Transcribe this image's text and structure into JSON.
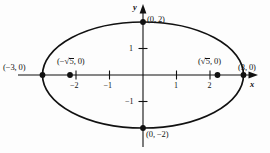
{
  "figure": {
    "kind": "ellipse-graph",
    "equation_implied": "x^2/9 + y^2/4 = 1",
    "background_color": "#fdfdfd",
    "stroke_color": "#111111"
  },
  "axes": {
    "x_axis_label": "x",
    "y_axis_label": "y",
    "origin_px": {
      "x": 143,
      "y": 75
    },
    "unit_px": {
      "x": 33.5,
      "y": 26.5
    },
    "x_ticks": [
      {
        "value": -2,
        "label": "−2",
        "px": 76
      },
      {
        "value": -1,
        "label": "−1",
        "px": 109.5
      },
      {
        "value": 1,
        "label": "1",
        "px": 176.5
      },
      {
        "value": 2,
        "label": "2",
        "px": 210
      }
    ],
    "y_ticks": [
      {
        "value": 1,
        "label": "1",
        "px": 48.5
      },
      {
        "value": -1,
        "label": "−1",
        "px": 101.5
      }
    ]
  },
  "curve": {
    "type": "ellipse",
    "center": [
      0,
      0
    ],
    "semi_major_a": 3,
    "semi_minor_b": 2,
    "orientation": "horizontal",
    "center_px": {
      "x": 143,
      "y": 75
    },
    "rx_px": 100.5,
    "ry_px": 53
  },
  "points": [
    {
      "name": "left-vertex",
      "label": "(−3, 0)",
      "coords": [
        -3,
        0
      ],
      "dot_px": {
        "x": 42.5,
        "y": 75
      },
      "label_px": {
        "x": 3,
        "y": 63
      },
      "dot_visible": true
    },
    {
      "name": "right-vertex",
      "label": "(3, 0)",
      "coords": [
        3,
        0
      ],
      "dot_px": {
        "x": 243.5,
        "y": 75
      },
      "label_px": {
        "x": 238,
        "y": 63
      },
      "dot_visible": true
    },
    {
      "name": "top-covertex",
      "label": "(0, 2)",
      "coords": [
        0,
        2
      ],
      "dot_px": {
        "x": 143,
        "y": 22
      },
      "label_px": {
        "x": 147,
        "y": 15
      },
      "dot_visible": true
    },
    {
      "name": "bottom-covertex",
      "label": "(0, −2)",
      "coords": [
        0,
        -2
      ],
      "dot_px": {
        "x": 143,
        "y": 128
      },
      "label_px": {
        "x": 146,
        "y": 130
      },
      "dot_visible": true
    },
    {
      "name": "left-focus",
      "label_prefix": "(−",
      "label_radical": "5",
      "label_suffix": ", 0)",
      "label_plain": "(−√5, 0)",
      "coords": [
        -2.236,
        0
      ],
      "dot_px": {
        "x": 70,
        "y": 75
      },
      "label_px": {
        "x": 57,
        "y": 57
      },
      "dot_visible": true
    },
    {
      "name": "right-focus",
      "label_prefix": "(",
      "label_radical": "5",
      "label_suffix": ", 0)",
      "label_plain": "(√5, 0)",
      "coords": [
        2.236,
        0
      ],
      "dot_px": {
        "x": 217.5,
        "y": 75
      },
      "label_px": {
        "x": 198,
        "y": 57
      },
      "dot_visible": true
    }
  ]
}
